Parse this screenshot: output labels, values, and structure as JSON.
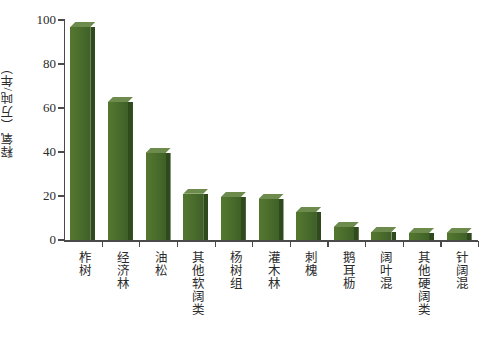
{
  "chart_data": {
    "type": "bar",
    "title": "",
    "xlabel": "",
    "ylabel": "释氧（万吨/年）",
    "ylim": [
      0,
      100
    ],
    "yticks": [
      0,
      20,
      40,
      60,
      80,
      100
    ],
    "grid": false,
    "legend": "none",
    "bar_color": "#4e7233",
    "bar_side_color": "#2f4a1d",
    "bar_top_color": "#6d8b4d",
    "axis_color": "#4a4a4a",
    "categories": [
      "柞树",
      "经济林",
      "油松",
      "其他软阔类",
      "杨树组",
      "灌木林",
      "刺槐",
      "鹅耳枥",
      "阔叶混",
      "其他硬阔类",
      "针阔混"
    ],
    "values": [
      96.8,
      62.7,
      39.5,
      21.0,
      19.6,
      18.6,
      12.7,
      5.9,
      3.6,
      3.2,
      3.2
    ]
  }
}
